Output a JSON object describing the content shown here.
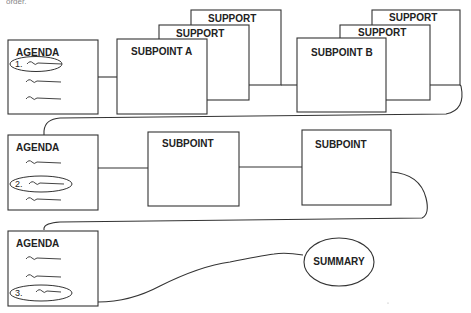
{
  "diagram": {
    "top_fragment": "order.",
    "rows": [
      {
        "agenda": {
          "title": "AGENDA",
          "highlighted_index": 1,
          "highlighted_label": "1."
        },
        "subpoints": [
          {
            "label": "SUBPOINT A",
            "supports": [
              "SUPPORT",
              "SUPPORT"
            ]
          },
          {
            "label": "SUBPOINT B",
            "supports": [
              "SUPPORT",
              "SUPPORT"
            ]
          }
        ]
      },
      {
        "agenda": {
          "title": "AGENDA",
          "highlighted_index": 2,
          "highlighted_label": "2."
        },
        "subpoints": [
          {
            "label": "SUBPOINT"
          },
          {
            "label": "SUBPOINT"
          }
        ]
      },
      {
        "agenda": {
          "title": "AGENDA",
          "highlighted_index": 3,
          "highlighted_label": "3."
        },
        "summary": {
          "label": "SUMMARY"
        }
      }
    ],
    "colors": {
      "stroke": "#333333",
      "background": "#ffffff",
      "text": "#222222"
    }
  }
}
